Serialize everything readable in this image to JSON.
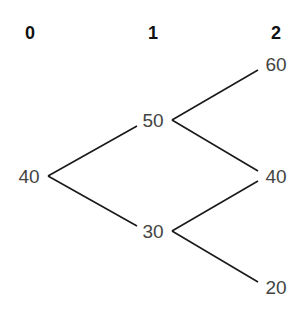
{
  "diagram": {
    "type": "binomial-tree",
    "time_steps": [
      {
        "label": "0"
      },
      {
        "label": "1"
      },
      {
        "label": "2"
      }
    ],
    "nodes": [
      {
        "id": "t0",
        "step": 0,
        "value": "40"
      },
      {
        "id": "t1_up",
        "step": 1,
        "value": "50"
      },
      {
        "id": "t1_down",
        "step": 1,
        "value": "30"
      },
      {
        "id": "t2_uu",
        "step": 2,
        "value": "60"
      },
      {
        "id": "t2_ud",
        "step": 2,
        "value": "40"
      },
      {
        "id": "t2_dd",
        "step": 2,
        "value": "20"
      }
    ],
    "edges": [
      {
        "from": "t0",
        "to": "t1_up"
      },
      {
        "from": "t0",
        "to": "t1_down"
      },
      {
        "from": "t1_up",
        "to": "t2_uu"
      },
      {
        "from": "t1_up",
        "to": "t2_ud"
      },
      {
        "from": "t1_down",
        "to": "t2_ud"
      },
      {
        "from": "t1_down",
        "to": "t2_dd"
      }
    ]
  }
}
